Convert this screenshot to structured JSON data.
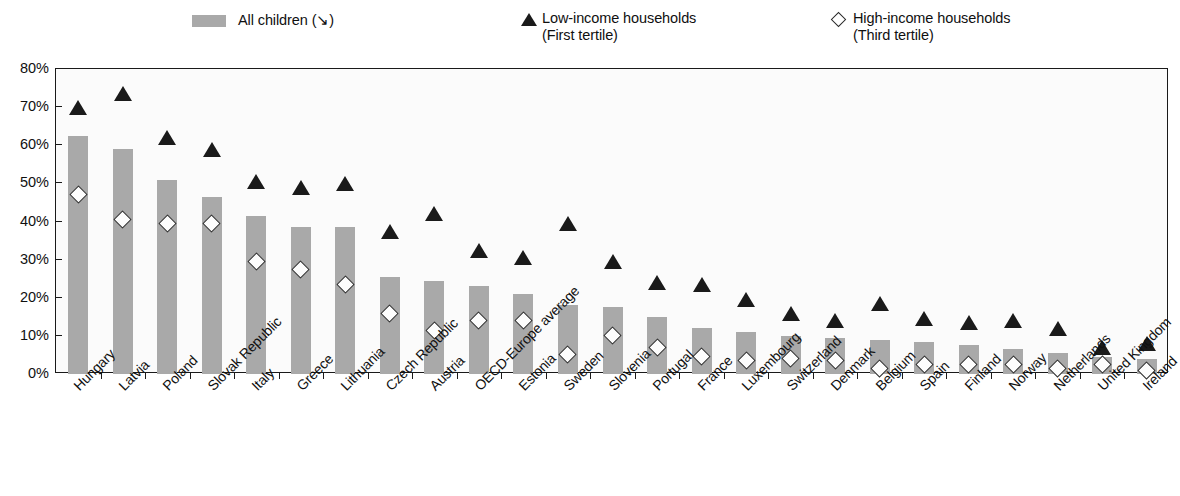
{
  "legend": {
    "all_children": "All children (↘)",
    "low_income_line1": "Low-income households",
    "low_income_line2": "(First tertile)",
    "high_income_line1": "High-income households",
    "high_income_line2": "(Third tertile)"
  },
  "colors": {
    "bar_fill": "#a9a9a9",
    "triangle": "#1a1a1a",
    "diamond_fill": "#ffffff",
    "diamond_stroke": "#2b2b2b",
    "plot_bg": "#fbfbfb",
    "axis": "#1a1a1a"
  },
  "chart_data": {
    "type": "bar",
    "title": "",
    "subtitle": "",
    "xlabel": "",
    "ylabel": "",
    "ylim": [
      0,
      80
    ],
    "ytick_labels": [
      "80%",
      "70%",
      "60%",
      "50%",
      "40%",
      "30%",
      "20%",
      "10%",
      "0%"
    ],
    "ytick_values": [
      80,
      70,
      60,
      50,
      40,
      30,
      20,
      10,
      0
    ],
    "grid": false,
    "legend_position": "top",
    "categories": [
      "Hungary",
      "Latvia",
      "Poland",
      "Slovak Republic",
      "Italy",
      "Greece",
      "Lithuania",
      "Czech Republic",
      "Austria",
      "OECD-Europe average",
      "Estonia",
      "Sweden",
      "Slovenia",
      "Portugal",
      "France",
      "Luxembourg",
      "Switzerland",
      "Denmark",
      "Belgium",
      "Spain",
      "Finland",
      "Norway",
      "Netherlands",
      "United Kingdom",
      "Ireland"
    ],
    "series": [
      {
        "name": "All children (↘)",
        "marker": "bar",
        "values": [
          62.5,
          59.0,
          51.0,
          46.5,
          41.5,
          38.5,
          38.5,
          25.5,
          24.5,
          23.0,
          21.0,
          18.0,
          17.5,
          15.0,
          12.0,
          11.0,
          10.0,
          9.5,
          9.0,
          8.5,
          7.5,
          6.5,
          5.5,
          4.5,
          4.0
        ]
      },
      {
        "name": "Low-income households (First tertile)",
        "marker": "triangle",
        "values": [
          70.0,
          73.5,
          62.0,
          59.0,
          50.5,
          49.0,
          50.0,
          37.5,
          42.0,
          32.5,
          30.5,
          39.5,
          29.5,
          24.0,
          23.5,
          19.5,
          16.0,
          14.0,
          18.5,
          14.5,
          13.5,
          14.0,
          12.0,
          7.0,
          8.0
        ]
      },
      {
        "name": "High-income households (Third tertile)",
        "marker": "diamond",
        "values": [
          47.0,
          40.5,
          39.5,
          39.5,
          29.5,
          27.5,
          23.5,
          16.0,
          11.5,
          14.0,
          14.0,
          5.0,
          10.0,
          7.0,
          4.5,
          3.5,
          4.0,
          3.5,
          1.5,
          2.5,
          2.5,
          2.5,
          1.5,
          2.5,
          1.0
        ]
      }
    ]
  }
}
